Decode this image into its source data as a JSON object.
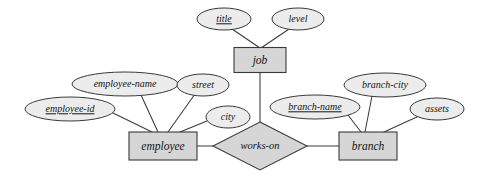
{
  "diagram": {
    "type": "entity-relationship-diagram",
    "colors": {
      "background": "#ffffff",
      "entity_fill": "#d6d6d6",
      "relationship_fill": "#d6d6d6",
      "attribute_fill": "#ececec",
      "stroke": "#3a3a3a",
      "text": "#141414"
    },
    "entities": [
      {
        "id": "job",
        "label": "job",
        "cx": 260,
        "cy": 60,
        "w": 52,
        "h": 25
      },
      {
        "id": "employee",
        "label": "employee",
        "cx": 163,
        "cy": 146,
        "w": 68,
        "h": 28
      },
      {
        "id": "branch",
        "label": "branch",
        "cx": 368,
        "cy": 146,
        "w": 58,
        "h": 28
      }
    ],
    "relationships": [
      {
        "id": "works-on",
        "label": "works-on",
        "cx": 260,
        "cy": 146,
        "rx": 47,
        "ry": 24
      }
    ],
    "attributes": [
      {
        "id": "title",
        "label": "title",
        "owner": "job",
        "key": true,
        "cx": 224,
        "cy": 19,
        "rx": 27,
        "ry": 11
      },
      {
        "id": "level",
        "label": "level",
        "owner": "job",
        "key": false,
        "cx": 298,
        "cy": 19,
        "rx": 26,
        "ry": 11
      },
      {
        "id": "employee-id",
        "label": "employee-id",
        "owner": "employee",
        "key": true,
        "cx": 70,
        "cy": 109,
        "rx": 45,
        "ry": 12
      },
      {
        "id": "employee-name",
        "label": "employee-name",
        "owner": "employee",
        "key": false,
        "cx": 125,
        "cy": 84,
        "rx": 53,
        "ry": 12
      },
      {
        "id": "street",
        "label": "street",
        "owner": "employee",
        "key": false,
        "cx": 203,
        "cy": 85,
        "rx": 26,
        "ry": 11
      },
      {
        "id": "city",
        "label": "city",
        "owner": "employee",
        "key": false,
        "cx": 228,
        "cy": 117,
        "rx": 22,
        "ry": 11
      },
      {
        "id": "branch-name",
        "label": "branch-name",
        "owner": "branch",
        "key": true,
        "cx": 315,
        "cy": 107,
        "rx": 45,
        "ry": 12
      },
      {
        "id": "branch-city",
        "label": "branch-city",
        "owner": "branch",
        "key": false,
        "cx": 385,
        "cy": 85,
        "rx": 41,
        "ry": 12
      },
      {
        "id": "assets",
        "label": "assets",
        "owner": "branch",
        "key": false,
        "cx": 437,
        "cy": 109,
        "rx": 27,
        "ry": 11
      }
    ],
    "edges": [
      {
        "id": "title-job",
        "from": "title",
        "to": "job",
        "x1": 232,
        "y1": 29,
        "x2": 260,
        "y2": 48
      },
      {
        "id": "level-job",
        "from": "level",
        "to": "job",
        "x1": 289,
        "y1": 29,
        "x2": 261,
        "y2": 48
      },
      {
        "id": "job-works-on",
        "from": "job",
        "to": "works-on",
        "x1": 260,
        "y1": 73,
        "x2": 260,
        "y2": 122
      },
      {
        "id": "employee-id-employee",
        "from": "employee-id",
        "to": "employee",
        "x1": 113,
        "y1": 113,
        "x2": 152,
        "y2": 132
      },
      {
        "id": "employee-name-employee",
        "from": "employee-name",
        "to": "employee",
        "x1": 141,
        "y1": 95,
        "x2": 158,
        "y2": 132
      },
      {
        "id": "street-employee",
        "from": "street",
        "to": "employee",
        "x1": 195,
        "y1": 94,
        "x2": 168,
        "y2": 132
      },
      {
        "id": "city-employee",
        "from": "city",
        "to": "employee",
        "x1": 207,
        "y1": 121,
        "x2": 180,
        "y2": 132
      },
      {
        "id": "employee-works-on",
        "from": "employee",
        "to": "works-on",
        "x1": 197,
        "y1": 146,
        "x2": 213,
        "y2": 146
      },
      {
        "id": "works-on-branch",
        "from": "works-on",
        "to": "branch",
        "x1": 307,
        "y1": 146,
        "x2": 339,
        "y2": 146
      },
      {
        "id": "branch-name-branch",
        "from": "branch-name",
        "to": "branch",
        "x1": 348,
        "y1": 115,
        "x2": 361,
        "y2": 132
      },
      {
        "id": "branch-city-branch",
        "from": "branch-city",
        "to": "branch",
        "x1": 372,
        "y1": 96,
        "x2": 365,
        "y2": 132
      },
      {
        "id": "assets-branch",
        "from": "assets",
        "to": "branch",
        "x1": 419,
        "y1": 116,
        "x2": 384,
        "y2": 132
      }
    ]
  }
}
